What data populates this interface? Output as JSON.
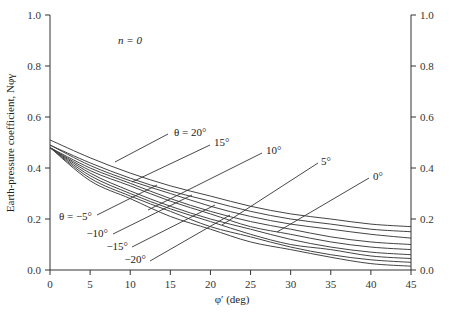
{
  "chart_data": {
    "type": "line",
    "title": "",
    "annotation": "n = 0",
    "xlabel": "φ′ (deg)",
    "ylabel": "Earth-pressure coefficient, Nφγ",
    "xlim": [
      0,
      45
    ],
    "ylim": [
      0.0,
      1.0
    ],
    "xticks": [
      0,
      5,
      10,
      15,
      20,
      25,
      30,
      35,
      40,
      45
    ],
    "yticks": [
      0.0,
      0.2,
      0.4,
      0.6,
      0.8,
      1.0
    ],
    "ytick_labels": [
      "0.0",
      "0.2",
      "0.4",
      "0.6",
      "0.8",
      "1.0"
    ],
    "right_axis_mirrored": true,
    "grid": false,
    "x": [
      0,
      5,
      10,
      15,
      20,
      25,
      30,
      35,
      40,
      45
    ],
    "series": [
      {
        "name": "θ = 20°",
        "values": [
          0.51,
          0.44,
          0.38,
          0.33,
          0.29,
          0.25,
          0.22,
          0.2,
          0.18,
          0.17
        ]
      },
      {
        "name": "θ = 15°",
        "values": [
          0.49,
          0.42,
          0.36,
          0.31,
          0.27,
          0.23,
          0.2,
          0.18,
          0.16,
          0.15
        ]
      },
      {
        "name": "θ = 10°",
        "values": [
          0.49,
          0.41,
          0.35,
          0.3,
          0.25,
          0.21,
          0.18,
          0.16,
          0.14,
          0.125
        ]
      },
      {
        "name": "θ = 5°",
        "values": [
          0.48,
          0.4,
          0.34,
          0.28,
          0.23,
          0.19,
          0.16,
          0.13,
          0.11,
          0.1
        ]
      },
      {
        "name": "θ = 0°",
        "values": [
          0.48,
          0.39,
          0.33,
          0.27,
          0.22,
          0.17,
          0.14,
          0.11,
          0.09,
          0.08
        ]
      },
      {
        "name": "θ = −5°",
        "values": [
          0.48,
          0.38,
          0.31,
          0.25,
          0.2,
          0.16,
          0.12,
          0.09,
          0.07,
          0.06
        ]
      },
      {
        "name": "θ = −10°",
        "values": [
          0.48,
          0.37,
          0.3,
          0.24,
          0.19,
          0.14,
          0.1,
          0.08,
          0.055,
          0.045
        ]
      },
      {
        "name": "θ = −15°",
        "values": [
          0.48,
          0.36,
          0.29,
          0.23,
          0.17,
          0.13,
          0.09,
          0.06,
          0.04,
          0.03
        ]
      },
      {
        "name": "θ = −20°",
        "values": [
          0.48,
          0.35,
          0.28,
          0.21,
          0.16,
          0.11,
          0.08,
          0.05,
          0.025,
          0.015
        ]
      }
    ],
    "curve_labels": [
      {
        "text": "θ = 20°",
        "x": 20.5,
        "y": 0.56
      },
      {
        "text": "15°",
        "x": 22,
        "y": 0.525
      },
      {
        "text": "10°",
        "x": 27.5,
        "y": 0.505
      },
      {
        "text": "5°",
        "x": 34.5,
        "y": 0.485
      },
      {
        "text": "0°",
        "x": 41.5,
        "y": 0.445
      },
      {
        "text": "θ = −5°",
        "x": 0.5,
        "y": 0.185
      },
      {
        "text": "−10°",
        "x": 4.8,
        "y": 0.145
      },
      {
        "text": "−15°",
        "x": 6.8,
        "y": 0.105
      },
      {
        "text": "−20°",
        "x": 9,
        "y": 0.065
      }
    ],
    "legend_position": "inline-annotations"
  },
  "labels": {
    "annotation": "n = 0",
    "xlabel": "φ′ (deg)",
    "ylabel": "Earth-pressure coefficient, Nφγ"
  }
}
